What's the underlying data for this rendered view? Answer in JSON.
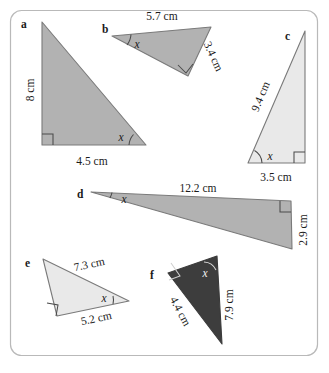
{
  "figure": {
    "background_color": "#ffffff",
    "border_color": "#b9b9b9",
    "fill_colors": {
      "medium_gray": "#b2b2b2",
      "light_gray": "#e9e9e9",
      "dark_gray": "#3d3d3d"
    },
    "angle_symbol": "x",
    "unit": "cm"
  },
  "triangles": [
    {
      "id": "a",
      "letter": "a",
      "fill": "#b2b2b2",
      "labels": [
        {
          "name": "vertical-side",
          "text": "8 cm"
        },
        {
          "name": "horizontal-side",
          "text": "4.5 cm"
        },
        {
          "name": "angle",
          "text": "x"
        }
      ]
    },
    {
      "id": "b",
      "letter": "b",
      "fill": "#b2b2b2",
      "labels": [
        {
          "name": "top-side",
          "text": "5.7 cm"
        },
        {
          "name": "right-side",
          "text": "3.4 cm"
        },
        {
          "name": "angle",
          "text": "x"
        }
      ]
    },
    {
      "id": "c",
      "letter": "c",
      "fill": "#e9e9e9",
      "labels": [
        {
          "name": "hypotenuse",
          "text": "9.4 cm"
        },
        {
          "name": "base",
          "text": "3.5 cm"
        },
        {
          "name": "angle",
          "text": "x"
        }
      ]
    },
    {
      "id": "d",
      "letter": "d",
      "fill": "#b2b2b2",
      "labels": [
        {
          "name": "top-side",
          "text": "12.2 cm"
        },
        {
          "name": "right-side",
          "text": "2.9 cm"
        },
        {
          "name": "angle",
          "text": "x"
        }
      ]
    },
    {
      "id": "e",
      "letter": "e",
      "fill": "#e9e9e9",
      "labels": [
        {
          "name": "hypotenuse",
          "text": "7.3 cm"
        },
        {
          "name": "base",
          "text": "5.2 cm"
        },
        {
          "name": "angle",
          "text": "x"
        }
      ]
    },
    {
      "id": "f",
      "letter": "f",
      "fill": "#3d3d3d",
      "labels": [
        {
          "name": "left-side",
          "text": "4.4 cm"
        },
        {
          "name": "right-side",
          "text": "7.9 cm"
        },
        {
          "name": "angle",
          "text": "x"
        }
      ]
    }
  ]
}
